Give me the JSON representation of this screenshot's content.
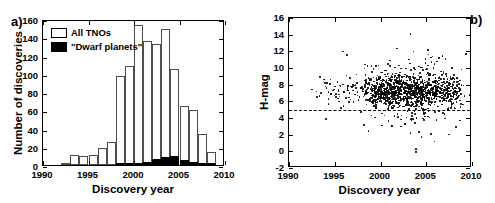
{
  "figure": {
    "panel_a_label": "a)",
    "panel_b_label": "b)"
  },
  "chart_data": [
    {
      "type": "bar",
      "panel": "a",
      "title": "",
      "xlabel": "Discovery year",
      "ylabel": "Number of discoveries",
      "xlim": [
        1990,
        2010
      ],
      "ylim": [
        0,
        160
      ],
      "xticks": [
        1990,
        1995,
        2000,
        2005,
        2010
      ],
      "xticklabels": [
        "1990",
        "1995",
        "2000",
        "2005",
        "2010"
      ],
      "yticks": [
        0,
        20,
        40,
        60,
        80,
        100,
        120,
        140,
        160
      ],
      "yticklabels": [
        "0",
        "20",
        "40",
        "60",
        "80",
        "100",
        "120",
        "140",
        "160"
      ],
      "grid": false,
      "legend_position": "upper-left",
      "legend": [
        "All TNOs",
        "\"Dwarf planets\""
      ],
      "categories": [
        1992,
        1993,
        1994,
        1995,
        1996,
        1997,
        1998,
        1999,
        2000,
        2001,
        2002,
        2003,
        2004,
        2005,
        2006,
        2007,
        2008,
        2009
      ],
      "series": [
        {
          "name": "All TNOs",
          "values": [
            2,
            11,
            10,
            11,
            19,
            25,
            98,
            109,
            153,
            136,
            133,
            149,
            105,
            65,
            60,
            34,
            14,
            0
          ]
        },
        {
          "name": "\"Dwarf planets\"",
          "values": [
            0,
            0,
            0,
            0,
            0,
            0,
            1,
            1,
            2,
            3,
            7,
            9,
            10,
            5,
            3,
            2,
            1,
            0
          ]
        }
      ]
    },
    {
      "type": "scatter",
      "panel": "b",
      "title": "",
      "xlabel": "Discovery year",
      "ylabel": "H-mag",
      "xlim": [
        1990,
        2010
      ],
      "ylim": [
        -2,
        16
      ],
      "xticks": [
        1990,
        1995,
        2000,
        2005,
        2010
      ],
      "xticklabels": [
        "1990",
        "1995",
        "2000",
        "2005",
        "2010"
      ],
      "yticks": [
        -2,
        0,
        2,
        4,
        6,
        8,
        10,
        12,
        14,
        16
      ],
      "yticklabels": [
        "-2",
        "0",
        "2",
        "4",
        "6",
        "8",
        "10",
        "12",
        "14",
        "16"
      ],
      "grid": false,
      "annotations": [
        {
          "type": "hline",
          "y": 5,
          "style": "dashed",
          "label": "dwarf planet H-mag threshold"
        }
      ],
      "marker": "point",
      "marker_color": "#000000",
      "points": [
        [
          1992.5,
          7.4
        ],
        [
          1993.0,
          7.2
        ],
        [
          1993.4,
          8.9
        ],
        [
          1993.5,
          7.0
        ],
        [
          1993.8,
          8.6
        ],
        [
          1994.1,
          7.6
        ],
        [
          1994.3,
          7.1
        ],
        [
          1994.5,
          8.1
        ],
        [
          1994.6,
          6.8
        ],
        [
          1994.8,
          7.3
        ],
        [
          1995.0,
          7.8
        ],
        [
          1995.1,
          6.9
        ],
        [
          1995.3,
          8.3
        ],
        [
          1995.4,
          7.2
        ],
        [
          1995.5,
          6.6
        ],
        [
          1995.6,
          7.9
        ],
        [
          1995.7,
          5.2
        ],
        [
          1995.9,
          8.0
        ],
        [
          1996.0,
          7.1
        ],
        [
          1996.2,
          6.4
        ],
        [
          1996.3,
          9.1
        ],
        [
          1996.4,
          7.5
        ],
        [
          1996.5,
          4.9
        ],
        [
          1996.6,
          7.0
        ],
        [
          1996.7,
          6.2
        ],
        [
          1996.9,
          7.7
        ],
        [
          1997.0,
          7.3
        ],
        [
          1997.2,
          6.8
        ],
        [
          1997.4,
          8.2
        ],
        [
          1997.5,
          7.1
        ],
        [
          1997.7,
          6.5
        ],
        [
          1997.9,
          7.6
        ],
        [
          1998.1,
          7.2
        ],
        [
          1998.3,
          8.5
        ],
        [
          1998.4,
          6.9
        ],
        [
          1998.5,
          7.4
        ],
        [
          1998.6,
          7.0
        ],
        [
          1998.7,
          8.8
        ],
        [
          1998.8,
          6.3
        ],
        [
          1998.9,
          7.5
        ],
        [
          1999.0,
          7.2
        ],
        [
          1999.0,
          8.0
        ],
        [
          1999.1,
          6.7
        ],
        [
          1999.1,
          9.5
        ],
        [
          1999.2,
          7.3
        ],
        [
          1999.2,
          6.1
        ],
        [
          1999.3,
          7.8
        ],
        [
          1999.3,
          8.4
        ],
        [
          1999.4,
          7.0
        ],
        [
          1999.4,
          6.5
        ],
        [
          1999.5,
          7.6
        ],
        [
          1999.5,
          10.2
        ],
        [
          1999.6,
          7.1
        ],
        [
          1999.6,
          8.2
        ],
        [
          1999.7,
          6.8
        ],
        [
          1999.7,
          7.4
        ],
        [
          1999.8,
          9.0
        ],
        [
          1999.8,
          6.2
        ],
        [
          1999.9,
          7.7
        ],
        [
          1999.9,
          8.1
        ],
        [
          2000.0,
          7.2
        ],
        [
          2000.0,
          6.6
        ],
        [
          2000.1,
          8.0
        ],
        [
          2000.1,
          7.5
        ],
        [
          2000.2,
          6.9
        ],
        [
          2000.2,
          7.1
        ],
        [
          2000.3,
          8.6
        ],
        [
          2000.3,
          6.4
        ],
        [
          2000.4,
          7.8
        ],
        [
          2000.4,
          7.3
        ],
        [
          2000.5,
          6.7
        ],
        [
          2000.5,
          9.2
        ],
        [
          2000.6,
          7.0
        ],
        [
          2000.6,
          8.3
        ],
        [
          2000.7,
          6.1
        ],
        [
          2000.7,
          7.6
        ],
        [
          2000.8,
          7.2
        ],
        [
          2000.8,
          10.5
        ],
        [
          2000.9,
          6.8
        ],
        [
          2000.9,
          8.0
        ],
        [
          2001.0,
          7.4
        ],
        [
          2001.0,
          6.3
        ],
        [
          2001.1,
          7.9
        ],
        [
          2001.1,
          8.7
        ],
        [
          2001.2,
          7.1
        ],
        [
          2001.2,
          6.6
        ],
        [
          2001.3,
          7.5
        ],
        [
          2001.3,
          9.3
        ],
        [
          2001.4,
          6.9
        ],
        [
          2001.4,
          7.2
        ],
        [
          2001.5,
          8.1
        ],
        [
          2001.5,
          6.4
        ],
        [
          2001.6,
          7.7
        ],
        [
          2001.6,
          7.0
        ],
        [
          2001.7,
          6.2
        ],
        [
          2001.7,
          8.4
        ],
        [
          2001.8,
          7.3
        ],
        [
          2001.8,
          5.8
        ],
        [
          2001.9,
          7.6
        ],
        [
          2001.9,
          6.7
        ],
        [
          2002.0,
          7.1
        ],
        [
          2002.0,
          8.9
        ],
        [
          2002.1,
          6.5
        ],
        [
          2002.1,
          7.4
        ],
        [
          2002.2,
          7.8
        ],
        [
          2002.2,
          6.0
        ],
        [
          2002.3,
          7.2
        ],
        [
          2002.3,
          4.3
        ],
        [
          2002.4,
          6.8
        ],
        [
          2002.4,
          8.2
        ],
        [
          2002.5,
          7.5
        ],
        [
          2002.5,
          6.3
        ],
        [
          2002.6,
          7.0
        ],
        [
          2002.6,
          9.0
        ],
        [
          2002.7,
          7.7
        ],
        [
          2002.7,
          6.6
        ],
        [
          2002.8,
          7.3
        ],
        [
          2002.8,
          5.5
        ],
        [
          2002.9,
          8.5
        ],
        [
          2002.9,
          6.9
        ],
        [
          2003.0,
          7.2
        ],
        [
          2003.0,
          6.4
        ],
        [
          2003.1,
          7.9
        ],
        [
          2003.1,
          11.0
        ],
        [
          2003.2,
          6.8
        ],
        [
          2003.2,
          7.5
        ],
        [
          2003.3,
          14.1
        ],
        [
          2003.3,
          7.1
        ],
        [
          2003.4,
          6.2
        ],
        [
          2003.4,
          8.3
        ],
        [
          2003.5,
          7.6
        ],
        [
          2003.5,
          6.7
        ],
        [
          2003.6,
          7.0
        ],
        [
          2003.6,
          12.0
        ],
        [
          2003.7,
          7.4
        ],
        [
          2003.7,
          6.5
        ],
        [
          2003.8,
          8.0
        ],
        [
          2003.8,
          3.4
        ],
        [
          2003.9,
          7.2
        ],
        [
          2003.9,
          0.3
        ],
        [
          2004.0,
          6.9
        ],
        [
          2004.0,
          7.7
        ],
        [
          2004.1,
          6.1
        ],
        [
          2004.1,
          8.6
        ],
        [
          2004.2,
          7.3
        ],
        [
          2004.2,
          6.6
        ],
        [
          2004.3,
          7.0
        ],
        [
          2004.3,
          9.4
        ],
        [
          2004.4,
          7.5
        ],
        [
          2004.4,
          6.3
        ],
        [
          2004.5,
          7.8
        ],
        [
          2004.5,
          1.7
        ],
        [
          2004.6,
          7.1
        ],
        [
          2004.6,
          6.8
        ],
        [
          2004.7,
          8.1
        ],
        [
          2004.7,
          7.4
        ],
        [
          2004.8,
          6.5
        ],
        [
          2004.8,
          7.2
        ],
        [
          2004.9,
          9.8
        ],
        [
          2004.9,
          6.0
        ],
        [
          2005.0,
          7.6
        ],
        [
          2005.0,
          7.0
        ],
        [
          2005.1,
          6.7
        ],
        [
          2005.1,
          8.4
        ],
        [
          2005.2,
          7.3
        ],
        [
          2005.2,
          10.3
        ],
        [
          2005.3,
          6.4
        ],
        [
          2005.3,
          7.9
        ],
        [
          2005.4,
          7.1
        ],
        [
          2005.4,
          6.9
        ],
        [
          2005.5,
          8.0
        ],
        [
          2005.5,
          2.1
        ],
        [
          2005.6,
          7.5
        ],
        [
          2005.6,
          6.2
        ],
        [
          2005.7,
          7.2
        ],
        [
          2005.7,
          9.1
        ],
        [
          2005.8,
          6.8
        ],
        [
          2005.8,
          7.7
        ],
        [
          2005.9,
          7.0
        ],
        [
          2005.9,
          6.5
        ],
        [
          2006.0,
          8.2
        ],
        [
          2006.0,
          7.4
        ],
        [
          2006.1,
          6.3
        ],
        [
          2006.1,
          7.1
        ],
        [
          2006.2,
          10.8
        ],
        [
          2006.2,
          6.9
        ],
        [
          2006.3,
          7.8
        ],
        [
          2006.3,
          7.2
        ],
        [
          2006.4,
          6.6
        ],
        [
          2006.4,
          8.5
        ],
        [
          2006.5,
          7.0
        ],
        [
          2006.5,
          6.1
        ],
        [
          2006.6,
          7.5
        ],
        [
          2006.6,
          9.6
        ],
        [
          2006.7,
          7.3
        ],
        [
          2006.7,
          6.7
        ],
        [
          2006.8,
          8.0
        ],
        [
          2006.8,
          4.6
        ],
        [
          2006.9,
          7.1
        ],
        [
          2006.9,
          6.4
        ],
        [
          2007.0,
          7.7
        ],
        [
          2007.0,
          7.2
        ],
        [
          2007.1,
          6.8
        ],
        [
          2007.1,
          11.1
        ],
        [
          2007.2,
          7.4
        ],
        [
          2007.2,
          6.0
        ],
        [
          2007.3,
          8.3
        ],
        [
          2007.3,
          7.0
        ],
        [
          2007.4,
          6.5
        ],
        [
          2007.4,
          7.6
        ],
        [
          2007.5,
          7.2
        ],
        [
          2007.5,
          2.0
        ],
        [
          2007.6,
          6.9
        ],
        [
          2007.6,
          8.1
        ],
        [
          2007.7,
          7.3
        ],
        [
          2007.7,
          6.3
        ],
        [
          2007.8,
          7.8
        ],
        [
          2007.8,
          10.0
        ],
        [
          2007.9,
          7.0
        ],
        [
          2007.9,
          6.6
        ],
        [
          2008.0,
          7.5
        ],
        [
          2008.0,
          7.1
        ],
        [
          2008.1,
          6.2
        ],
        [
          2008.1,
          8.7
        ],
        [
          2008.2,
          7.3
        ],
        [
          2008.2,
          6.8
        ],
        [
          2008.3,
          7.9
        ],
        [
          2008.3,
          5.9
        ],
        [
          2008.4,
          7.0
        ],
        [
          2008.4,
          6.4
        ],
        [
          2008.5,
          8.4
        ],
        [
          2008.5,
          7.2
        ],
        [
          2008.6,
          6.7
        ],
        [
          2008.6,
          7.6
        ],
        [
          2008.7,
          6.1
        ],
        [
          2008.7,
          7.4
        ],
        [
          2008.8,
          5.7
        ],
        [
          2008.8,
          6.9
        ]
      ]
    }
  ]
}
